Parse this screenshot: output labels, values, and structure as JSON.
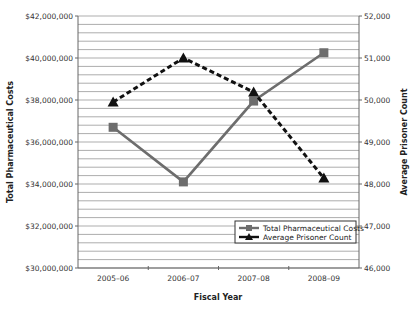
{
  "chart_data": {
    "type": "line",
    "title": "",
    "categories": [
      "2005–06",
      "2006–07",
      "2007–08",
      "2008–09"
    ],
    "xlabel": "Fiscal Year",
    "ylabel": "Total Pharmaceutical Costs",
    "y2label": "Average Prisoner Count",
    "ylim": [
      30000000,
      42000000
    ],
    "y2lim": [
      46000,
      52000
    ],
    "yticks": [
      "$30,000,000",
      "$32,000,000",
      "$34,000,000",
      "$36,000,000",
      "$38,000,000",
      "$40,000,000",
      "$42,000,000"
    ],
    "y2ticks": [
      "46,000",
      "47,000",
      "48,000",
      "49,000",
      "50,000",
      "51,000",
      "52,000"
    ],
    "grid": true,
    "legend_position": "lower right",
    "series": [
      {
        "name": "Total Pharmaceutical Costs",
        "axis": "left",
        "marker": "square",
        "style": "solid",
        "color": "#6d6d6d",
        "values": [
          36700000,
          34100000,
          37950000,
          40250000
        ]
      },
      {
        "name": "Average Prisoner Count",
        "axis": "right",
        "marker": "triangle",
        "style": "dashed",
        "color": "#111111",
        "values": [
          49950,
          51000,
          50190,
          48140
        ]
      }
    ]
  }
}
